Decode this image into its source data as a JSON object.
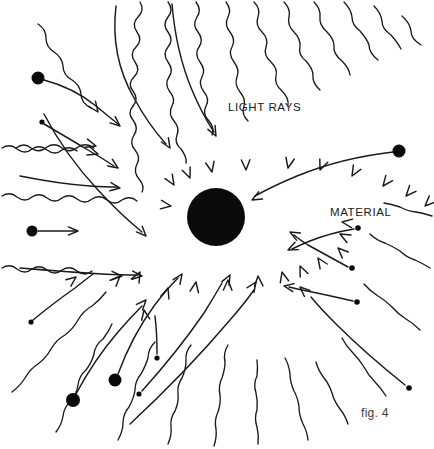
{
  "figure": {
    "domain": "Diagram",
    "caption": "fig. 4",
    "background_color": "#ffffff",
    "ink_color": "#1a1a1a",
    "width": 434,
    "height": 449
  },
  "labels": {
    "light_rays": "LIGHT RAYS",
    "material": "MATERIAL",
    "caption": "fig. 4"
  },
  "material_body": {
    "name": "material-sphere",
    "center_x": 216,
    "center_y": 217,
    "radius": 29,
    "color": "#0a0a0a"
  },
  "label_positions": {
    "light_rays": {
      "x": 228,
      "y": 111
    },
    "material": {
      "x": 330,
      "y": 216
    },
    "caption": {
      "x": 361,
      "y": 417
    }
  },
  "light_rays": [
    {
      "name": "ray-top-1",
      "d": "M 140 2 q 5 8 -2 15 q -7 7 -1 15 q 6 8 -1 15 q -7 7 -1 15 q 6 8 -1 15 q -7 7 -1 14 q 6 8 0 15 q -6 7 0 14 q 6 8 1 15 q -5 8 1 15 q 6 7 2 14 q -4 8 2 15 q 6 7 3 13",
      "arrow": {
        "x": 174,
        "y": 185,
        "angle": 58
      }
    },
    {
      "name": "ray-top-2",
      "d": "M 168 2 q 6 8 0 15 q -6 8 0 15 q 6 8 0 15 q -6 7 0 15 q 6 8 1 15 q -5 7 1 15 q 6 7 2 14 q -4 8 2 15 q 6 7 3 14 q -3 8 4 14 q 6 8 5 14",
      "arrow": {
        "x": 190,
        "y": 178,
        "angle": 68
      }
    },
    {
      "name": "ray-top-3",
      "d": "M 196 2 q 6 8 1 15 q -5 8 1 15 q 6 8 1 15 q -5 7 1 15 q 6 8 2 15 q -4 7 2 15 q 6 7 2 14 q -4 8 3 15 q 6 7 3 14",
      "arrow": {
        "x": 212,
        "y": 172,
        "angle": 78
      }
    },
    {
      "name": "ray-top-4",
      "d": "M 226 2 q 6 8 2 15 q -4 8 2 15 q 6 8 2 15 q -4 7 2 15 q 6 8 3 15 q -3 7 3 15 q 6 7 4 14 q -3 8 4 15",
      "arrow": {
        "x": 246,
        "y": 170,
        "angle": 88
      }
    },
    {
      "name": "ray-top-5",
      "d": "M 254 2 q 7 7 4 15 q -3 8 4 15 q 7 7 4 15 q -3 8 5 15 q 7 7 5 14 q -2 8 6 15 q 7 7 6 14",
      "arrow": {
        "x": 288,
        "y": 168,
        "angle": 102
      }
    },
    {
      "name": "ray-top-6",
      "d": "M 284 2 q 7 7 5 15 q -2 8 5 15 q 7 7 6 15 q -2 8 6 14 q 7 8 7 14 q -1 8 7 15",
      "arrow": {
        "x": 320,
        "y": 170,
        "angle": 112
      }
    },
    {
      "name": "ray-top-7",
      "d": "M 314 2 q 7 7 6 15 q -1 8 7 15 q 7 7 7 14 q -1 8 8 15 q 7 7 8 14",
      "arrow": {
        "x": 352,
        "y": 176,
        "angle": 120
      }
    },
    {
      "name": "ray-top-8",
      "d": "M 344 2 q 7 7 8 15 q 0 8 8 14 q 7 8 9 14 q 0 8 9 15",
      "arrow": {
        "x": 383,
        "y": 186,
        "angle": 128
      }
    },
    {
      "name": "ray-top-9",
      "d": "M 374 6 q 7 7 8 15 q 0 8 9 14 q 7 8 10 14",
      "arrow": {
        "x": 406,
        "y": 196,
        "angle": 132
      }
    },
    {
      "name": "ray-top-10",
      "d": "M 402 16 q 8 7 9 15 q 0 8 10 14",
      "arrow": {
        "x": 425,
        "y": 206,
        "angle": 136
      }
    },
    {
      "name": "ray-left-1",
      "d": "M 2 148 q 8 -5 15 1 q 8 6 15 0 q 8 -5 15 1 q 8 6 15 0 q 8 -5 15 1",
      "arrow": {
        "x": 98,
        "y": 154,
        "angle": 18
      }
    },
    {
      "name": "ray-left-2",
      "d": "M 2 196 q 8 -5 15 1 q 8 6 15 0 q 8 -5 15 1 q 8 6 15 0 q 8 -5 15 1 q 8 6 15 0 q 8 -5 15 1 q 8 6 15 0 q 8 -5 15 1",
      "arrow": {
        "x": 171,
        "y": 206,
        "angle": 8
      }
    },
    {
      "name": "ray-left-3",
      "d": "M 2 268 q 8 -5 15 1 q 8 6 15 0 q 8 -5 15 1 q 8 6 15 0 q 8 -5 15 1 q 8 6 15 0",
      "arrow": {
        "x": 122,
        "y": 276,
        "angle": 2
      }
    },
    {
      "name": "ray-diag-ul-1",
      "d": "M 16 148 q 8 -6 15 0 q 8 6 16 -1 q 8 -5 15 1 q 8 6 16 -1 q 8 -5 16 1",
      "arrow": {
        "x": 96,
        "y": 146,
        "angle": 16
      }
    },
    {
      "name": "ray-diag-ul-2",
      "d": "M 38 24 q 8 5 8 14 q 0 9 8 14 q 8 5 9 14 q 0 9 9 14 q 8 5 9 14 q 0 9 10 14",
      "arrow": {
        "x": 98,
        "y": 112,
        "angle": 54
      }
    },
    {
      "name": "ray-bl-1",
      "d": "M 12 392 q 8 -6 13 -14 q 5 -9 13 -14 q 8 -6 13 -15 q 5 -9 14 -14 q 8 -6 13 -15 q 5 -9 14 -14 q 8 -6 14 -14",
      "arrow": {
        "x": 120,
        "y": 276,
        "angle": -46
      }
    },
    {
      "name": "ray-bl-2",
      "d": "M 56 432 q 6 -8 7 -16 q 1 -9 8 -15 q 6 -8 7 -16 q 1 -9 8 -15 q 6 -8 8 -16 q 1 -9 9 -15 q 6 -8 9 -15",
      "arrow": {
        "x": 140,
        "y": 272,
        "angle": -62
      }
    },
    {
      "name": "ray-bl-3",
      "d": "M 118 440 q 5 -9 5 -17 q 0 -9 6 -16 q 5 -9 6 -17 q 0 -9 6 -16 q 5 -9 7 -16 q 0 -9 7 -16",
      "arrow": {
        "x": 168,
        "y": 288,
        "angle": -72
      }
    },
    {
      "name": "ray-bottom-1",
      "d": "M 168 444 q 4 -9 3 -17 q -1 -9 4 -16 q 4 -9 3 -17 q -1 -9 4 -16 q 4 -9 4 -17 q -1 -9 5 -16",
      "arrow": {
        "x": 196,
        "y": 282,
        "angle": -80
      }
    },
    {
      "name": "ray-bottom-2",
      "d": "M 214 446 q 3 -9 2 -17 q -2 -9 2 -17 q 3 -9 2 -17 q -2 -9 2 -17 q 3 -9 3 -16 q -2 -9 3 -17",
      "arrow": {
        "x": 228,
        "y": 280,
        "angle": -88
      }
    },
    {
      "name": "ray-bottom-3",
      "d": "M 258 444 q 1 -9 -1 -17 q -3 -9 0 -17 q 1 -9 -1 -17 q -3 -9 1 -17 q 1 -9 0 -16",
      "arrow": {
        "x": 258,
        "y": 276,
        "angle": -94
      }
    },
    {
      "name": "ray-br-1",
      "d": "M 308 440 q -1 -9 -5 -16 q -4 -9 -4 -17 q -1 -9 -5 -16 q -4 -9 -4 -17 q -1 -9 -5 -16",
      "arrow": {
        "x": 282,
        "y": 272,
        "angle": -104
      }
    },
    {
      "name": "ray-br-2",
      "d": "M 348 424 q -3 -9 -8 -15 q -6 -8 -8 -16 q -3 -9 -8 -15 q -6 -8 -8 -16",
      "arrow": {
        "x": 300,
        "y": 266,
        "angle": -114
      }
    },
    {
      "name": "ray-br-3",
      "d": "M 386 396 q -5 -8 -11 -14 q -7 -7 -11 -15 q -5 -8 -11 -14 q -7 -7 -11 -15",
      "arrow": {
        "x": 318,
        "y": 258,
        "angle": -124
      }
    },
    {
      "name": "ray-r-1",
      "d": "M 420 330 q -7 -7 -14 -11 q -8 -5 -14 -12 q -7 -7 -14 -11 q -8 -5 -14 -12",
      "arrow": {
        "x": 338,
        "y": 248,
        "angle": -136
      }
    },
    {
      "name": "ray-r-2",
      "d": "M 430 268 q -8 -5 -15 -8 q -9 -3 -15 -9 q -8 -5 -15 -8 q -9 -3 -15 -9",
      "arrow": {
        "x": 340,
        "y": 234,
        "angle": -152
      }
    },
    {
      "name": "ray-r-3",
      "d": "M 432 216 q -9 -3 -16 -4 q -9 -1 -16 -5 q -9 -3 -16 -4",
      "arrow": {
        "x": 342,
        "y": 222,
        "angle": -172
      }
    }
  ],
  "particle_tracks": [
    {
      "name": "particle-track-ul-large",
      "dot": {
        "x": 38,
        "y": 78,
        "r": 6.5
      },
      "d": "M 44 80 q 30 8 52 26 q 12 10 22 18",
      "arrow": {
        "x": 120,
        "y": 126,
        "angle": 40
      }
    },
    {
      "name": "particle-track-ul-small",
      "dot": {
        "x": 42,
        "y": 122,
        "r": 2.6
      },
      "d": "M 44 124 q 24 14 44 26 q 14 8 26 16",
      "arrow": {
        "x": 118,
        "y": 168,
        "angle": 34
      }
    },
    {
      "name": "particle-track-left-mid",
      "dot": {
        "x": 32,
        "y": 231,
        "r": 5.5
      },
      "d": "M 38 231 q 20 0 38 0",
      "arrow": {
        "x": 78,
        "y": 231,
        "angle": 0
      }
    },
    {
      "name": "particle-track-left-in",
      "dot": null,
      "d": "M 20 176 q 40 8 70 10 q 16 1 28 1",
      "arrow": {
        "x": 120,
        "y": 188,
        "angle": 8
      }
    },
    {
      "name": "particle-track-left-low",
      "dot": null,
      "d": "M 20 268 q 48 4 82 6 q 20 1 36 1",
      "arrow": {
        "x": 142,
        "y": 276,
        "angle": 5
      }
    },
    {
      "name": "particle-track-left-sweep",
      "dot": null,
      "d": "M 44 114 q 22 42 54 76 q 22 24 44 42",
      "arrow": {
        "x": 146,
        "y": 236,
        "angle": 46
      }
    },
    {
      "name": "particle-track-curve-top",
      "dot": null,
      "d": "M 116 6 q -6 50 18 92 q 14 26 32 46",
      "arrow": {
        "x": 170,
        "y": 148,
        "angle": 58
      }
    },
    {
      "name": "particle-track-curve-top2",
      "dot": null,
      "d": "M 172 4 q 4 48 20 86 q 10 24 22 42",
      "arrow": {
        "x": 216,
        "y": 136,
        "angle": 62
      }
    },
    {
      "name": "particle-track-bl-1",
      "dot": {
        "x": 31,
        "y": 322,
        "r": 2.6
      },
      "d": "M 33 320 q 22 -18 42 -32 q 10 -8 18 -14",
      "arrow": {
        "x": 76,
        "y": 277,
        "angle": -38
      }
    },
    {
      "name": "particle-track-bl-2",
      "dot": {
        "x": 73,
        "y": 400,
        "r": 7
      },
      "d": "M 76 394 q 18 -34 42 -62 q 12 -14 24 -26",
      "arrow": {
        "x": 146,
        "y": 300,
        "angle": -48
      }
    },
    {
      "name": "particle-track-bl-3",
      "dot": {
        "x": 115,
        "y": 380,
        "r": 6.5
      },
      "d": "M 118 374 q 14 -38 36 -68 q 12 -16 24 -28",
      "arrow": {
        "x": 182,
        "y": 274,
        "angle": -56
      }
    },
    {
      "name": "particle-track-bl-4",
      "dot": {
        "x": 157,
        "y": 358,
        "r": 2.6
      },
      "d": "M 157 354 q 0 -22 -2 -38",
      "arrow": {
        "x": 144,
        "y": 310,
        "angle": -100
      }
    },
    {
      "name": "particle-track-b-1",
      "dot": {
        "x": 139,
        "y": 394,
        "r": 2.6
      },
      "d": "M 142 391 q 36 -40 62 -78 q 10 -16 18 -30",
      "arrow": {
        "x": 230,
        "y": 275,
        "angle": -62
      }
    },
    {
      "name": "particle-track-b-2",
      "dot": null,
      "d": "M 130 424 q 56 -52 100 -104 q 14 -16 24 -30",
      "arrow": {
        "x": 256,
        "y": 282,
        "angle": -56
      }
    },
    {
      "name": "particle-track-br-1",
      "dot": {
        "x": 409,
        "y": 388,
        "r": 2.8
      },
      "d": "M 405 385 q -40 -32 -70 -62 q -14 -14 -24 -26",
      "arrow": {
        "x": 300,
        "y": 287,
        "angle": -138
      }
    },
    {
      "name": "particle-track-br-2",
      "dot": {
        "x": 357,
        "y": 302,
        "r": 2.8
      },
      "d": "M 353 301 q -26 -6 -46 -10 q -10 -2 -18 -4",
      "arrow": {
        "x": 284,
        "y": 286,
        "angle": -170
      }
    },
    {
      "name": "particle-track-r-1",
      "dot": {
        "x": 352,
        "y": 268,
        "r": 2.8
      },
      "d": "M 348 267 q -22 -12 -40 -22 q -8 -5 -14 -10",
      "arrow": {
        "x": 290,
        "y": 232,
        "angle": -152
      }
    },
    {
      "name": "particle-track-r-2",
      "dot": {
        "x": 358,
        "y": 228,
        "r": 2.8
      },
      "d": "M 354 229 q -24 4 -44 12 q -10 4 -18 8",
      "arrow": {
        "x": 288,
        "y": 250,
        "angle": 155
      }
    },
    {
      "name": "particle-track-ur-large",
      "dot": {
        "x": 399,
        "y": 151,
        "r": 6.5
      },
      "d": "M 393 152 q -52 6 -96 24 q -24 10 -42 20",
      "arrow": {
        "x": 252,
        "y": 200,
        "angle": 152
      }
    }
  ]
}
